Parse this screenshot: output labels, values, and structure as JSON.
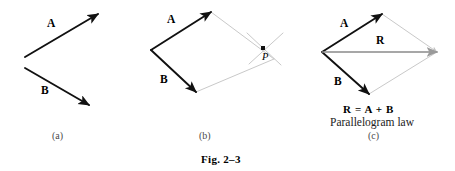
{
  "figure": {
    "caption": "Fig. 2–3",
    "background_color": "#ffffff",
    "vector_color": "#111111",
    "resultant_color": "#8a8a8a",
    "construction_color": "#c9c9c9"
  },
  "panels": [
    {
      "id": "a",
      "label": "(a)",
      "label_pos": {
        "x": 52,
        "y": 131
      },
      "vectors": [
        {
          "name": "A",
          "label": "A",
          "label_pos": {
            "x": 47,
            "y": 18
          },
          "x1": 25,
          "y1": 57,
          "x2": 98,
          "y2": 14,
          "color": "#111111",
          "width": 1.9,
          "head": "solid"
        },
        {
          "name": "B",
          "label": "B",
          "label_pos": {
            "x": 41,
            "y": 85
          },
          "x1": 25,
          "y1": 68,
          "x2": 89,
          "y2": 105,
          "color": "#111111",
          "width": 1.9,
          "head": "solid"
        }
      ]
    },
    {
      "id": "b",
      "label": "(b)",
      "label_pos": {
        "x": 199,
        "y": 131
      },
      "origin": {
        "x": 151,
        "y": 50
      },
      "vectors": [
        {
          "name": "A",
          "label": "A",
          "label_pos": {
            "x": 167,
            "y": 14
          },
          "x1": 151,
          "y1": 50,
          "x2": 211,
          "y2": 12,
          "color": "#111111",
          "width": 1.9,
          "head": "solid"
        },
        {
          "name": "B",
          "label": "B",
          "label_pos": {
            "x": 160,
            "y": 74
          },
          "x1": 151,
          "y1": 50,
          "x2": 196,
          "y2": 92,
          "color": "#111111",
          "width": 1.9,
          "head": "solid"
        }
      ],
      "construction_edges": [
        {
          "name": "edge-a-to-apex",
          "x1": 211,
          "y1": 12,
          "x2": 274,
          "y2": 59
        },
        {
          "name": "edge-b-to-apex",
          "x1": 196,
          "y1": 92,
          "x2": 274,
          "y2": 59
        }
      ],
      "construction_ticks": [
        {
          "name": "tick-nw-se",
          "x1": 247,
          "y1": 33,
          "x2": 281,
          "y2": 65
        },
        {
          "name": "tick-ne-sw",
          "x1": 249,
          "y1": 64,
          "x2": 283,
          "y2": 33
        }
      ],
      "point": {
        "name": "P",
        "label": "P",
        "x": 263,
        "y": 48,
        "label_pos": {
          "x": 262,
          "y": 52
        }
      }
    },
    {
      "id": "c",
      "label": "(c)",
      "label_pos": {
        "x": 368,
        "y": 131
      },
      "origin": {
        "x": 322,
        "y": 52
      },
      "apex": {
        "x": 437,
        "y": 52
      },
      "vectors": [
        {
          "name": "A",
          "label": "A",
          "label_pos": {
            "x": 340,
            "y": 18
          },
          "x1": 322,
          "y1": 52,
          "x2": 382,
          "y2": 14,
          "color": "#111111",
          "width": 1.9,
          "head": "solid"
        },
        {
          "name": "B",
          "label": "B",
          "label_pos": {
            "x": 334,
            "y": 76
          },
          "x1": 322,
          "y1": 52,
          "x2": 369,
          "y2": 94,
          "color": "#111111",
          "width": 1.9,
          "head": "solid"
        },
        {
          "name": "R",
          "label": "R",
          "label_pos": {
            "x": 376,
            "y": 35
          },
          "x1": 322,
          "y1": 52,
          "x2": 437,
          "y2": 52,
          "color": "#8a8a8a",
          "width": 1.6,
          "head": "open"
        }
      ],
      "construction_edges": [
        {
          "name": "edge-a-to-apex",
          "x1": 382,
          "y1": 14,
          "x2": 437,
          "y2": 52
        },
        {
          "name": "edge-b-to-apex",
          "x1": 369,
          "y1": 94,
          "x2": 437,
          "y2": 52
        }
      ],
      "equation": {
        "text": "R = A + B",
        "pos": {
          "x": 343,
          "y": 104
        }
      },
      "law_name": {
        "text": "Parallelogram law",
        "pos": {
          "x": 330,
          "y": 117
        }
      }
    }
  ],
  "caption_pos": {
    "x": 201,
    "y": 154
  }
}
